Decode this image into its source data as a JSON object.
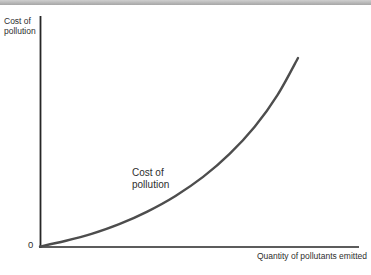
{
  "figure": {
    "y_axis_label": "Cost of pollution",
    "x_axis_label": "Quantity of pollutants emitted",
    "origin_label": "0",
    "curve_annotation": "Cost of pollution"
  },
  "colors": {
    "curve": "#4d4d4d",
    "axis": "#262626",
    "text": "#2e2e2e",
    "top_bar": "#a6a6a6"
  },
  "chart_data": {
    "type": "line",
    "title": "",
    "xlabel": "Quantity of pollutants emitted",
    "ylabel": "Cost of pollution",
    "x_range": [
      0,
      1
    ],
    "y_range": [
      0,
      1
    ],
    "grid": false,
    "legend": "none",
    "annotations": [
      "Cost of pollution",
      "0"
    ],
    "series": [
      {
        "name": "Cost of pollution",
        "units": "normalized (no numeric ticks shown; only 0 at origin)",
        "points": [
          [
            0.0,
            0.0
          ],
          [
            0.097,
            0.029
          ],
          [
            0.2,
            0.067
          ],
          [
            0.307,
            0.119
          ],
          [
            0.416,
            0.185
          ],
          [
            0.525,
            0.268
          ],
          [
            0.632,
            0.369
          ],
          [
            0.735,
            0.491
          ],
          [
            0.832,
            0.635
          ],
          [
            0.921,
            0.804
          ],
          [
            1.0,
            1.0
          ]
        ]
      }
    ]
  }
}
